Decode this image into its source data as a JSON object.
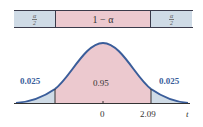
{
  "interval_bar": {
    "left_tail": {
      "numerator": "α",
      "denominator": "2"
    },
    "middle_label": "1 − α",
    "right_tail": {
      "numerator": "α",
      "denominator": "2"
    }
  },
  "curve": {
    "left_area": "0.025",
    "center_area": "0.95",
    "right_area": "0.025",
    "tick_center": "0",
    "tick_right": "2.09",
    "axis_label": "t"
  },
  "colors": {
    "tail_fill": "#cfdbe6",
    "center_fill": "#ecc9cf",
    "curve_stroke": "#3a5d9a",
    "label_blue": "#3a5d9a"
  }
}
